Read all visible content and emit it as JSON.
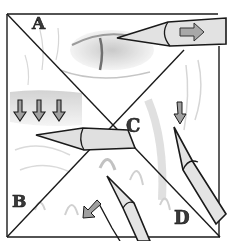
{
  "figure": {
    "panels": [
      {
        "id": "A",
        "label": "A",
        "position": "top-triangle",
        "note": "pencil shading horizontal, arrow pointing right"
      },
      {
        "id": "B",
        "label": "B",
        "position": "left-bottom-triangle",
        "note": "arrow pointing down-left"
      },
      {
        "id": "C",
        "label": "C",
        "position": "center-right",
        "note": "pencil shading, arrow pointing down"
      },
      {
        "id": "D",
        "label": "D",
        "position": "bottom-right-triangle",
        "note": "pencil pointing up-left"
      }
    ],
    "arrows": {
      "row_count": 3,
      "direction_row": "down",
      "direction_A": "right",
      "direction_B": "down-left",
      "direction_C": "down"
    },
    "colors": {
      "line": "#1a1a1a",
      "arrow_fill": "#9a9a9a",
      "pencil_fill": "#dcdcdc",
      "shading": "#c8c8c8",
      "background": "#ffffff"
    }
  }
}
